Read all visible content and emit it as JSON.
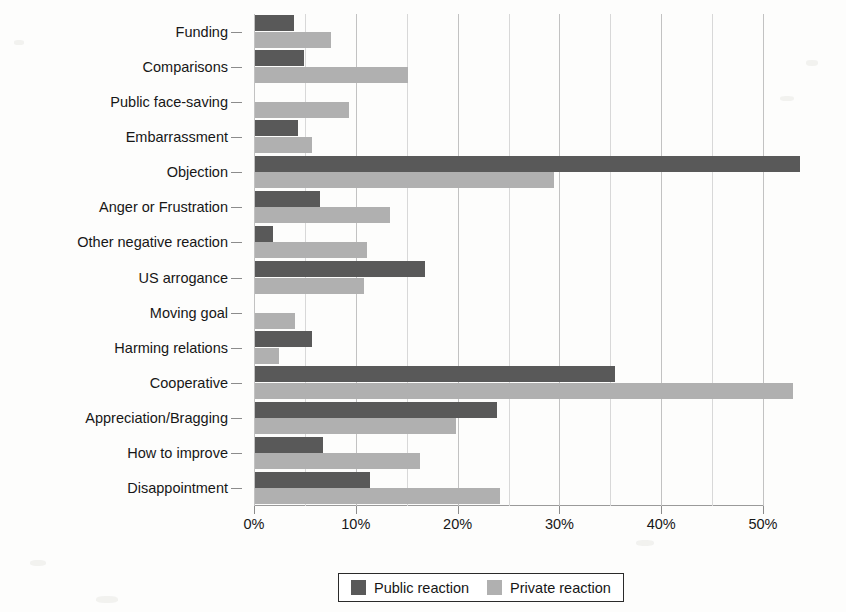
{
  "chart_data": {
    "type": "bar",
    "orientation": "horizontal",
    "title": "",
    "xlabel": "",
    "ylabel": "",
    "xlim": [
      0,
      55
    ],
    "xticks": [
      "0%",
      "10%",
      "20%",
      "30%",
      "40%",
      "50%"
    ],
    "xtick_values": [
      0,
      10,
      20,
      30,
      40,
      50
    ],
    "minor_tick_step": 5,
    "grid": true,
    "grid_axis": "x",
    "legend_position": "bottom-center",
    "categories": [
      "Funding",
      "Comparisons",
      "Public face-saving",
      "Embarrassment",
      "Objection",
      "Anger or Frustration",
      "Other negative reaction",
      "US arrogance",
      "Moving goal",
      "Harming relations",
      "Cooperative",
      "Appreciation/Bragging",
      "How to improve",
      "Disappointment"
    ],
    "series": [
      {
        "name": "Public reaction",
        "color": "#595959",
        "values": [
          3.8,
          4.8,
          0.0,
          4.2,
          53.5,
          6.4,
          1.8,
          16.7,
          0.0,
          5.6,
          35.4,
          23.8,
          6.7,
          11.3
        ]
      },
      {
        "name": "Private reaction",
        "color": "#b0b0b0",
        "values": [
          7.5,
          15.0,
          9.2,
          5.6,
          29.4,
          13.3,
          11.0,
          10.7,
          3.9,
          2.4,
          52.8,
          19.7,
          16.2,
          24.1
        ]
      }
    ]
  },
  "legend": {
    "items": [
      {
        "label": "Public reaction",
        "swatch": "public"
      },
      {
        "label": "Private reaction",
        "swatch": "private"
      }
    ]
  }
}
